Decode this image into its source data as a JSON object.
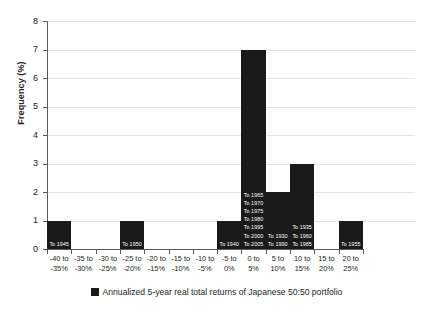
{
  "chart_data": {
    "type": "bar",
    "title": "",
    "xlabel": "",
    "ylabel": "Frequency (%)",
    "ylim": [
      0,
      8
    ],
    "yticks": [
      0,
      1,
      2,
      3,
      4,
      5,
      6,
      7,
      8
    ],
    "grid": true,
    "legend_position": "bottom",
    "categories": [
      "-40 to -35%",
      "-35 to -30%",
      "-30 to -25%",
      "-25 to -20%",
      "-20 to -15%",
      "-15 to -10%",
      "-10 to -5%",
      "-5 to 0%",
      "0 to 5%",
      "5 to 10%",
      "10 to 15%",
      "15 to 20%",
      "20 to 25%"
    ],
    "category_lines": [
      [
        "-40 to",
        "-35%"
      ],
      [
        "-35 to",
        "-30%"
      ],
      [
        "-30 to",
        "-25%"
      ],
      [
        "-25 to",
        "-20%"
      ],
      [
        "-20 to",
        "-15%"
      ],
      [
        "-15 to",
        "-10%"
      ],
      [
        "-10 to",
        "-5%"
      ],
      [
        "-5 to",
        "0%"
      ],
      [
        "0 to",
        "5%"
      ],
      [
        "5 to",
        "10%"
      ],
      [
        "10 to",
        "15%"
      ],
      [
        "15 to",
        "20%"
      ],
      [
        "20 to",
        "25%"
      ]
    ],
    "values": [
      1,
      0,
      0,
      1,
      0,
      0,
      0,
      1,
      7,
      2,
      3,
      0,
      1
    ],
    "point_labels": [
      [
        "To 1945"
      ],
      [],
      [],
      [
        "To 1950"
      ],
      [],
      [],
      [],
      [
        "To 1940"
      ],
      [
        "To 1965",
        "To 1970",
        "To 1975",
        "To 1980",
        "To 1995",
        "To 2000",
        "To 2005"
      ],
      [
        "To 1930",
        "To 1990"
      ],
      [
        "To 1935",
        "To 1960",
        "To 1985"
      ],
      [],
      [
        "To 1955"
      ]
    ],
    "series": [
      {
        "name": "Annualized 5-year real total returns of Japanese 50:50 portfolio",
        "color": "#1a1a1a",
        "values": [
          1,
          0,
          0,
          1,
          0,
          0,
          0,
          1,
          7,
          2,
          3,
          0,
          1
        ]
      }
    ]
  },
  "legend": {
    "label": "Annualized 5-year real total returns of Japanese 50:50 portfolio",
    "swatch_color": "#1a1a1a"
  },
  "axis": {
    "y_title": "Frequency (%)"
  }
}
